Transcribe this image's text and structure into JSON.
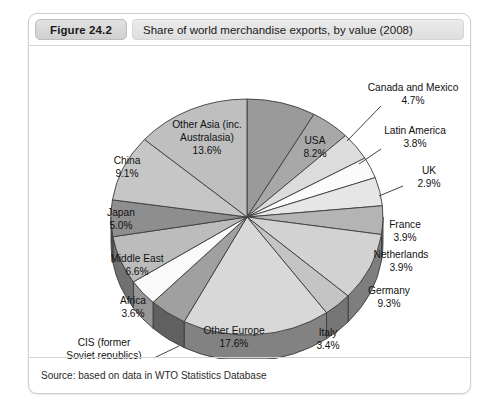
{
  "figure": {
    "badge": "Figure 24.2",
    "title": "Share of world merchandise exports, by value (2008)",
    "source": "Source: based on data in WTO Statistics Database"
  },
  "chart_data": {
    "type": "pie",
    "title": "Share of world merchandise exports, by value (2008)",
    "unit": "percent",
    "start_angle_deg": -90,
    "direction": "clockwise",
    "three_d": true,
    "labels_inside": [
      "USA",
      "Canada and Mexico",
      "Latin America",
      "UK",
      "France",
      "Netherlands",
      "Germany",
      "Italy",
      "Other Europe",
      "CIS (former Soviet republics)",
      "Africa",
      "Middle East",
      "Japan",
      "China",
      "Other Asia (inc. Australasia)"
    ],
    "categories": [
      "USA",
      "Canada and Mexico",
      "Latin America",
      "UK",
      "France",
      "Netherlands",
      "Germany",
      "Italy",
      "Other Europe",
      "CIS (former Soviet republics)",
      "Africa",
      "Middle East",
      "Japan",
      "China",
      "Other Asia (inc. Australasia)"
    ],
    "values": [
      8.2,
      4.7,
      3.8,
      2.9,
      3.9,
      3.9,
      9.3,
      3.4,
      17.6,
      4.5,
      3.6,
      6.6,
      5.0,
      9.1,
      13.6
    ],
    "value_labels": [
      "8.2%",
      "4.7%",
      "3.8%",
      "2.9%",
      "3.9%",
      "3.9%",
      "9.3%",
      "3.4%",
      "17.6%",
      "4.5%",
      "3.6%",
      "6.6%",
      "5.0%",
      "9.1%",
      "13.6%"
    ],
    "colors": [
      "#9a9a9a",
      "#a8a8a8",
      "#dcdcdc",
      "#fbfbfb",
      "#e6e6e6",
      "#b4b4b4",
      "#d2d2d2",
      "#c4c4c4",
      "#d8d8d8",
      "#a0a0a0",
      "#fafafa",
      "#bcbcbc",
      "#8e8e8e",
      "#c6c6c6",
      "#bfbfbf"
    ],
    "legend": "none",
    "grid": false
  },
  "slices": [
    {
      "name": "USA",
      "pct": "8.2%",
      "label_lines": [
        "USA"
      ]
    },
    {
      "name": "Canada and Mexico",
      "pct": "4.7%",
      "label_lines": [
        "Canada and Mexico"
      ]
    },
    {
      "name": "Latin America",
      "pct": "3.8%",
      "label_lines": [
        "Latin America"
      ]
    },
    {
      "name": "UK",
      "pct": "2.9%",
      "label_lines": [
        "UK"
      ]
    },
    {
      "name": "France",
      "pct": "3.9%",
      "label_lines": [
        "France"
      ]
    },
    {
      "name": "Netherlands",
      "pct": "3.9%",
      "label_lines": [
        "Netherlands"
      ]
    },
    {
      "name": "Germany",
      "pct": "9.3%",
      "label_lines": [
        "Germany"
      ]
    },
    {
      "name": "Italy",
      "pct": "3.4%",
      "label_lines": [
        "Italy"
      ]
    },
    {
      "name": "Other Europe",
      "pct": "17.6%",
      "label_lines": [
        "Other Europe"
      ]
    },
    {
      "name": "CIS (former Soviet republics)",
      "pct": "4.5%",
      "label_lines": [
        "CIS (former",
        "Soviet republics)"
      ]
    },
    {
      "name": "Africa",
      "pct": "3.6%",
      "label_lines": [
        "Africa"
      ]
    },
    {
      "name": "Middle East",
      "pct": "6.6%",
      "label_lines": [
        "Middle East"
      ]
    },
    {
      "name": "Japan",
      "pct": "5.0%",
      "label_lines": [
        "Japan"
      ]
    },
    {
      "name": "China",
      "pct": "9.1%",
      "label_lines": [
        "China"
      ]
    },
    {
      "name": "Other Asia (inc. Australasia)",
      "pct": "13.6%",
      "label_lines": [
        "Other Asia (inc.",
        "Australasia)"
      ]
    }
  ]
}
